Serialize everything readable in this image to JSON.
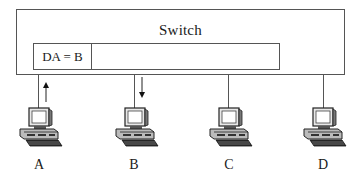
{
  "switch": {
    "title": "Switch",
    "frame": {
      "destination_field": "DA = B",
      "payload_field": ""
    }
  },
  "hosts": [
    {
      "label": "A",
      "role": "sender",
      "arrow": "up"
    },
    {
      "label": "B",
      "role": "receiver",
      "arrow": "down"
    },
    {
      "label": "C",
      "role": "none",
      "arrow": "none"
    },
    {
      "label": "D",
      "role": "none",
      "arrow": "none"
    }
  ],
  "icons": {
    "host": "desktop-computer-icon",
    "arrow_up": "arrow-up-icon",
    "arrow_down": "arrow-down-icon"
  },
  "colors": {
    "line": "#555555",
    "text": "#1a1a1a",
    "background": "#ffffff"
  }
}
